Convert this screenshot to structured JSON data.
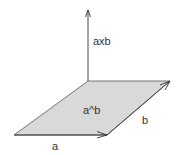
{
  "diagram": {
    "labels": {
      "cross_product": "axb",
      "wedge_product": "a^b",
      "vector_a": "a",
      "vector_b": "b"
    },
    "colors": {
      "fill": "#d9d9d9",
      "stroke": "#333333",
      "background": "#ffffff"
    },
    "geometry": {
      "origin": [
        88,
        81
      ],
      "axis_tip": [
        88,
        10
      ],
      "parallelogram": [
        [
          14,
          135
        ],
        [
          107,
          135
        ],
        [
          170,
          81
        ],
        [
          88,
          81
        ]
      ]
    }
  }
}
